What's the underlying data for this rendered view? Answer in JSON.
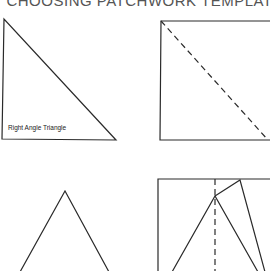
{
  "page": {
    "title": "CHOOSING PATCHWORK TEMPLATES"
  },
  "templates": [
    {
      "id": "right-angle-triangle",
      "label": "Right Angle Triangle",
      "shape": "right triangle",
      "stroke": "#2a2a2a"
    },
    {
      "id": "square-with-diagonal",
      "label": "",
      "shape": "square with dashed diagonal",
      "stroke": "#2a2a2a"
    },
    {
      "id": "isosceles-triangle",
      "label": "",
      "shape": "isosceles triangle",
      "stroke": "#2a2a2a"
    },
    {
      "id": "rectangle-with-triangle-construction",
      "label": "",
      "shape": "rectangle with inscribed triangle and dashed center line",
      "stroke": "#2a2a2a"
    }
  ],
  "colors": {
    "background": "#ffffff",
    "line": "#2a2a2a",
    "title": "#555555"
  }
}
